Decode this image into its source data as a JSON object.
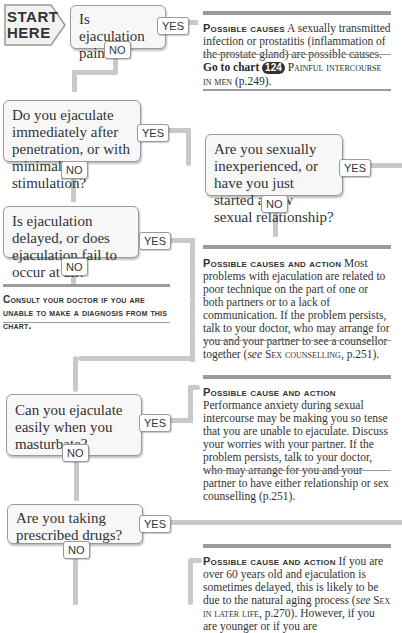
{
  "start": {
    "line1": "START",
    "line2": "HERE"
  },
  "labels": {
    "yes": "YES",
    "no": "NO"
  },
  "questions": [
    {
      "id": "q1",
      "text": "Is ejaculation painful?"
    },
    {
      "id": "q2",
      "text": "Do you ejaculate immediately after penetration, or with minimal stimulation?"
    },
    {
      "id": "q3",
      "text": "Are you sexually inexperienced, or have you just started a new sexual relationship?"
    },
    {
      "id": "q4",
      "text": "Is ejaculation delayed, or does ejaculation fail to occur at all?"
    },
    {
      "id": "q5",
      "text": "Can you ejaculate easily when you masturbate?"
    },
    {
      "id": "q6",
      "text": "Are you taking prescribed drugs?"
    }
  ],
  "outcomes": {
    "o1": {
      "heading": "Possible causes",
      "body": "A sexually transmitted infection or prostatitis (inflammation of the prostate gland) are possible causes.",
      "goto_prefix": "Go to chart",
      "goto_number": "124",
      "goto_title": "Painful intercourse in men",
      "goto_page": "(p.249)."
    },
    "o2": {
      "heading": "Possible causes and action",
      "body": "Most problems with ejaculation are related to poor technique on the part of one or both partners or to a lack of communication. If the problem persists, talk to your doctor, who may arrange for you and your partner to see a counsellor together (",
      "see": "see",
      "ref": "Sex counselling",
      "ref_page": ", p.251)."
    },
    "consult": {
      "text": "Consult your doctor if you are unable to make a diagnosis from this chart."
    },
    "o3": {
      "heading": "Possible cause and action",
      "body": "Performance anxiety during sexual intercourse may be making you so tense that you are unable to ejaculate. Discuss your worries with your partner. If the problem persists, talk to your doctor, who may arrange for you and your partner to have either relationship or sex counselling (p.251)."
    },
    "o4": {
      "heading": "Possible cause and action",
      "body1": "If you are over 60 years old and ejaculation is sometimes delayed, this is likely to be due to the natural aging process (",
      "see": "see",
      "ref": "Sex in later life",
      "ref_page": ", p.270).",
      "body2": "However, if you are younger or if you are"
    }
  }
}
